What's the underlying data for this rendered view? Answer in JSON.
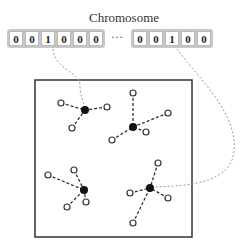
{
  "title": "Chromosome",
  "chromosome": {
    "left_genes": [
      "0",
      "0",
      "1",
      "0",
      "0",
      "0"
    ],
    "ellipsis": "···",
    "right_genes": [
      "0",
      "0",
      "1",
      "0",
      "0"
    ]
  },
  "clusters": [
    {
      "name": "top-left",
      "centroid": [
        85,
        110
      ],
      "points": [
        [
          61,
          103
        ],
        [
          107,
          107
        ],
        [
          72,
          128
        ]
      ]
    },
    {
      "name": "top-right",
      "centroid": [
        133,
        127
      ],
      "points": [
        [
          133,
          93
        ],
        [
          168,
          113
        ],
        [
          146,
          132
        ],
        [
          112,
          140
        ]
      ]
    },
    {
      "name": "bottom-left",
      "centroid": [
        84,
        190
      ],
      "points": [
        [
          48,
          175
        ],
        [
          74,
          170
        ],
        [
          86,
          202
        ],
        [
          67,
          207
        ]
      ]
    },
    {
      "name": "bottom-right",
      "centroid": [
        150,
        188
      ],
      "points": [
        [
          158,
          163
        ],
        [
          130,
          193
        ],
        [
          168,
          198
        ],
        [
          133,
          223
        ]
      ]
    }
  ],
  "colors": {
    "line": "#333333",
    "dotted": "#999999",
    "box": "#333333",
    "strip": "#c8c8c8"
  }
}
